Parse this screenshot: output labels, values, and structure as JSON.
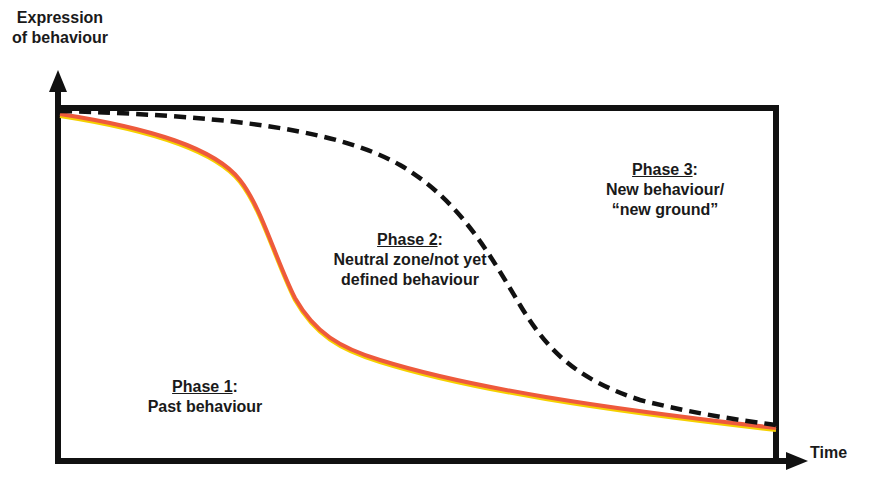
{
  "diagram": {
    "y_axis_label_line1": "Expression",
    "y_axis_label_line2": "of behaviour",
    "x_axis_label": "Time",
    "phases": [
      {
        "title": "Phase 1",
        "colon": ":",
        "desc_line1": "Past behaviour",
        "desc_line2": ""
      },
      {
        "title": "Phase 2",
        "colon": ":",
        "desc_line1": "Neutral zone/not yet",
        "desc_line2": "defined behaviour"
      },
      {
        "title": "Phase 3",
        "colon": ":",
        "desc_line1": "New behaviour/",
        "desc_line2": "“new ground”"
      }
    ],
    "curves": [
      {
        "name": "past-behaviour-curve",
        "style": "solid",
        "color": "#ee5a3c",
        "highlight": "#f5d000"
      },
      {
        "name": "new-behaviour-curve",
        "style": "dashed",
        "color": "#111111"
      }
    ],
    "colors": {
      "axis": "#111111",
      "text": "#1a1a1a",
      "background": "#ffffff"
    }
  }
}
